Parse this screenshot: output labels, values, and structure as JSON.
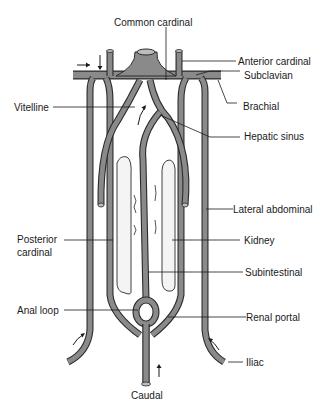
{
  "figure": {
    "colors": {
      "vessel_fill": "#8a8a8a",
      "vessel_outline": "#2a2a2a",
      "kidney_fill": "#f4f4f4",
      "text": "#1a1a1a",
      "background": "#ffffff"
    }
  },
  "labels": {
    "common_cardinal": "Common cardinal",
    "anterior_cardinal": "Anterior cardinal",
    "subclavian": "Subclavian",
    "vitelline": "Vitelline",
    "brachial": "Brachial",
    "hepatic_sinus": "Hepatic sinus",
    "lateral_abdominal": "Lateral abdominal",
    "posterior_cardinal_1": "Posterior",
    "posterior_cardinal_2": "cardinal",
    "kidney": "Kidney",
    "subintestinal": "Subintestinal",
    "anal_loop": "Anal loop",
    "renal_portal": "Renal portal",
    "iliac": "Iliac",
    "caudal": "Caudal"
  },
  "arrows": [
    {
      "name": "flow-arrow-right",
      "direction": "right",
      "location": "left of subclavian"
    },
    {
      "name": "flow-arrow-down",
      "direction": "down",
      "location": "left anterior cardinal"
    },
    {
      "name": "flow-arrow-up-hepatic",
      "direction": "up",
      "location": "below hepatic sinus"
    },
    {
      "name": "flow-arrow-up-left-iliac",
      "direction": "up-right",
      "location": "left iliac"
    },
    {
      "name": "flow-arrow-up-right-iliac",
      "direction": "up-left",
      "location": "right iliac"
    },
    {
      "name": "flow-arrow-up-caudal",
      "direction": "up",
      "location": "caudal"
    }
  ]
}
